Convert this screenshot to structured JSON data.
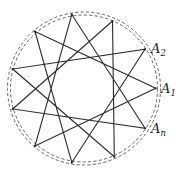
{
  "diagram": {
    "type": "star-polygon",
    "vertex_count": 11,
    "step": 4,
    "center": [
      84,
      88.5
    ],
    "vertices": [
      [
        155.7,
        88.3
      ],
      [
        145,
        49.3
      ],
      [
        112.5,
        21
      ],
      [
        71.8,
        14.5
      ],
      [
        35,
        31.5
      ],
      [
        12.7,
        69
      ],
      [
        12.7,
        109
      ],
      [
        35,
        146
      ],
      [
        71.8,
        162.5
      ],
      [
        114.3,
        156.7
      ],
      [
        145,
        128.3
      ]
    ],
    "dashed_circles": [
      {
        "r": 73.5
      },
      {
        "r": 76.5
      }
    ],
    "labels": [
      {
        "base": "A",
        "sub": "2",
        "vertex": 1,
        "x": 151,
        "y": 53
      },
      {
        "base": "A",
        "sub": "1",
        "vertex": 0,
        "x": 161,
        "y": 93
      },
      {
        "base": "A",
        "sub": "n",
        "vertex": 10,
        "x": 151,
        "y": 133
      }
    ],
    "colors": {
      "line": "#2a2a2a",
      "dash": "#555555"
    }
  }
}
